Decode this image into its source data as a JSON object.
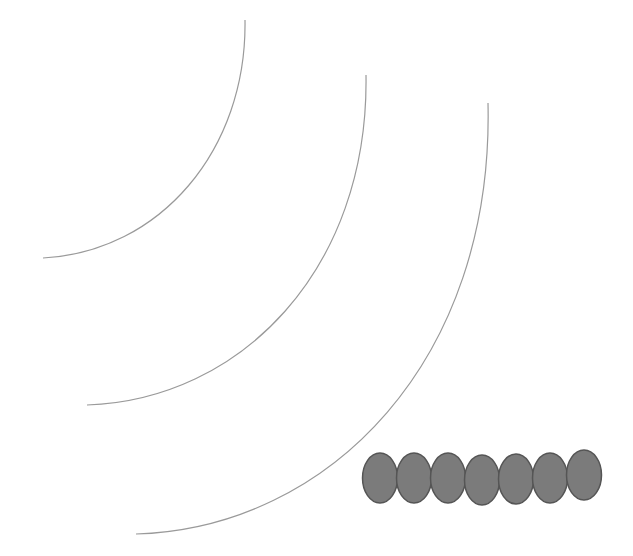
{
  "diagram": {
    "colors": {
      "background": "#ffffff",
      "arc_stroke": "#9a9a9a",
      "ellipse_fill": "#7b7b7b",
      "ellipse_stroke": "#555555"
    },
    "arcs": [
      {
        "id": "arc-inner",
        "path": "M245,20 C247,150 160,252 43,258"
      },
      {
        "id": "arc-middle",
        "path": "M366,75 C369,270 240,400 87,405"
      },
      {
        "id": "arc-outer",
        "path": "M488,103 C494,360 330,528 136,534"
      }
    ],
    "ellipses": [
      {
        "cx": 380,
        "cy": 478,
        "rx": 17.5,
        "ry": 25
      },
      {
        "cx": 414,
        "cy": 478,
        "rx": 17.5,
        "ry": 25
      },
      {
        "cx": 448,
        "cy": 478,
        "rx": 17.5,
        "ry": 25
      },
      {
        "cx": 482,
        "cy": 480,
        "rx": 17.5,
        "ry": 25
      },
      {
        "cx": 516,
        "cy": 479,
        "rx": 17.5,
        "ry": 25
      },
      {
        "cx": 550,
        "cy": 478,
        "rx": 17.5,
        "ry": 25
      },
      {
        "cx": 584,
        "cy": 475,
        "rx": 17.5,
        "ry": 25
      }
    ]
  }
}
